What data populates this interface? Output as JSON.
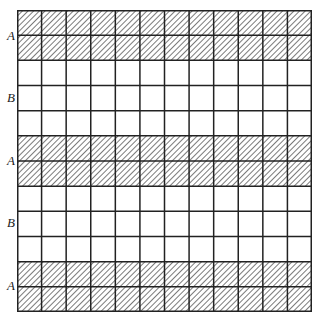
{
  "diagram": {
    "rows": 12,
    "cols": 12,
    "bands": [
      {
        "label": "A",
        "rows": [
          0,
          1
        ],
        "fill": "hatched"
      },
      {
        "label": "B",
        "rows": [
          2,
          3,
          4
        ],
        "fill": "white"
      },
      {
        "label": "A",
        "rows": [
          5,
          6
        ],
        "fill": "hatched"
      },
      {
        "label": "B",
        "rows": [
          7,
          8,
          9
        ],
        "fill": "white"
      },
      {
        "label": "A",
        "rows": [
          10,
          11
        ],
        "fill": "hatched"
      }
    ],
    "labels": [
      "A",
      "B",
      "A",
      "B",
      "A"
    ],
    "colors": {
      "line": "#222222",
      "hatch": "#333333",
      "background": "#ffffff"
    }
  }
}
